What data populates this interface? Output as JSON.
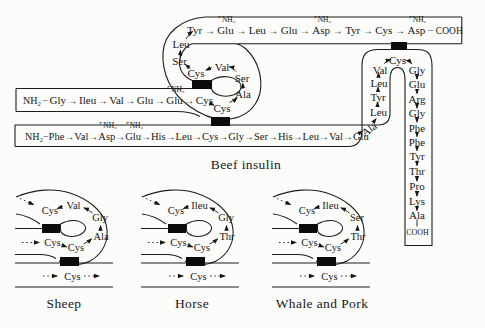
{
  "title": "Beef insulin",
  "glyphs": {
    "arrow": "→",
    "bond": "−",
    "amide": "⌜NH₂"
  },
  "beef": {
    "a_chain": {
      "nh2": "NH₂",
      "row": [
        "Gly",
        "Ileu",
        "Val",
        "Glu",
        "Glu",
        "Cys"
      ],
      "spiral": {
        "cys7": "Cys",
        "ala8": "Ala",
        "ser9": "Ser",
        "val10": "Val",
        "cys11": "Cys",
        "ser12": "Ser",
        "leu13": "Leu"
      },
      "top_row": [
        "Tyr",
        "Glu",
        "Leu",
        "Glu",
        "Asp",
        "Tyr",
        "Cys",
        "Asp"
      ],
      "cooh": "COOH"
    },
    "b_chain": {
      "nh2": "NH₂",
      "row": [
        "Phe",
        "Val",
        "Asp",
        "Glu",
        "His",
        "Leu",
        "Cys",
        "Gly",
        "Ser",
        "His",
        "Leu",
        "Val",
        "Glu"
      ],
      "bend": "Ala",
      "left_col": [
        "Leu",
        "Tyr",
        "Leu",
        "Val"
      ],
      "turn": "Cys",
      "right_col": [
        "Gly",
        "Glu",
        "Arg",
        "Gly",
        "Phe",
        "Phe",
        "Tyr",
        "Thr",
        "Pro",
        "Lys",
        "Ala"
      ],
      "cooh": "COOH"
    }
  },
  "variants": [
    {
      "label": "Sheep",
      "a11": "Cys",
      "a10": "Val",
      "a9": "Gly",
      "a8": "Ala",
      "a6": "Cys",
      "a7": "Cys",
      "b7": "Cys"
    },
    {
      "label": "Horse",
      "a11": "Cys",
      "a10": "Ileu",
      "a9": "Gly",
      "a8": "Thr",
      "a6": "Cys",
      "a7": "Cys",
      "b7": "Cys"
    },
    {
      "label": "Whale and Pork",
      "a11": "Cys",
      "a10": "Ileu",
      "a9": "Ser",
      "a8": "Thr",
      "a6": "Cys",
      "a7": "Cys",
      "b7": "Cys"
    }
  ]
}
